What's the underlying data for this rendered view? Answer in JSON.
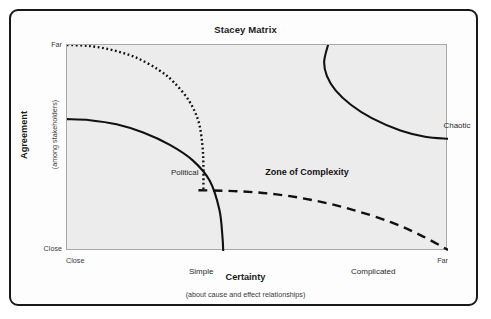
{
  "title": "Stacey Matrix",
  "axes": {
    "y": {
      "title": "Agreement",
      "subtitle": "(among stakeholders)",
      "tick_top": "Far",
      "tick_bottom": "Close"
    },
    "x": {
      "title": "Certainty",
      "subtitle": "(about cause and effect relationships)",
      "tick_left": "Close",
      "tick_right": "Far"
    }
  },
  "regions": [
    {
      "key": "political",
      "label": "Political",
      "style": "plain"
    },
    {
      "key": "zone",
      "label": "Zone of Complexity",
      "style": "bold"
    },
    {
      "key": "chaotic",
      "label": "Chaotic",
      "style": "plain"
    },
    {
      "key": "simple",
      "label": "Simple",
      "style": "plain"
    },
    {
      "key": "complicated",
      "label": "Complicated",
      "style": "plain"
    }
  ],
  "colors": {
    "frame_border": "#191919",
    "plot_fill": "#ececec",
    "plot_border": "#a8a8a8",
    "curve": "#111111",
    "page_background": "#ffffff",
    "text": "#2b2b2b"
  },
  "chart_data": {
    "type": "scatter",
    "title": "Stacey Matrix",
    "xlabel": "Certainty",
    "xlabel_sub": "(about cause and effect relationships)",
    "ylabel": "Agreement",
    "ylabel_sub": "(among stakeholders)",
    "xlim": [
      0,
      1
    ],
    "ylim": [
      0,
      1
    ],
    "xticks": [
      0,
      1
    ],
    "xticklabels": [
      "Close",
      "Far"
    ],
    "yticks": [
      0,
      1
    ],
    "yticklabels": [
      "Close",
      "Far"
    ],
    "grid": false,
    "legend": "none",
    "annotations": [
      {
        "text": "Political",
        "x": 0.12,
        "y": 0.62,
        "weight": "normal"
      },
      {
        "text": "Zone of Complexity",
        "x": 0.46,
        "y": 0.63,
        "weight": "bold"
      },
      {
        "text": "Chaotic",
        "x": 0.85,
        "y": 0.85,
        "weight": "normal"
      },
      {
        "text": "Simple",
        "x": 0.16,
        "y": 0.16,
        "weight": "normal"
      },
      {
        "text": "Complicated",
        "x": 0.6,
        "y": 0.16,
        "weight": "normal"
      }
    ],
    "series": [
      {
        "name": "Political boundary",
        "linestyle": "dotted",
        "points": [
          [
            0.0,
            1.0
          ],
          [
            0.06,
            0.995
          ],
          [
            0.12,
            0.975
          ],
          [
            0.18,
            0.94
          ],
          [
            0.24,
            0.88
          ],
          [
            0.28,
            0.82
          ],
          [
            0.32,
            0.73
          ],
          [
            0.345,
            0.63
          ],
          [
            0.355,
            0.52
          ],
          [
            0.358,
            0.42
          ],
          [
            0.358,
            0.3
          ]
        ]
      },
      {
        "name": "Simple boundary",
        "linestyle": "solid",
        "points": [
          [
            0.0,
            0.64
          ],
          [
            0.06,
            0.635
          ],
          [
            0.13,
            0.615
          ],
          [
            0.2,
            0.575
          ],
          [
            0.27,
            0.515
          ],
          [
            0.33,
            0.44
          ],
          [
            0.375,
            0.34
          ],
          [
            0.4,
            0.2
          ],
          [
            0.408,
            0.07
          ],
          [
            0.41,
            0.0
          ]
        ]
      },
      {
        "name": "Complicated boundary",
        "linestyle": "dashed",
        "points": [
          [
            0.345,
            0.295
          ],
          [
            0.45,
            0.29
          ],
          [
            0.55,
            0.275
          ],
          [
            0.65,
            0.245
          ],
          [
            0.75,
            0.2
          ],
          [
            0.85,
            0.14
          ],
          [
            0.93,
            0.075
          ],
          [
            1.0,
            0.005
          ]
        ]
      },
      {
        "name": "Chaotic boundary",
        "linestyle": "solid",
        "points": [
          [
            0.685,
            1.0
          ],
          [
            0.675,
            0.92
          ],
          [
            0.682,
            0.85
          ],
          [
            0.705,
            0.78
          ],
          [
            0.745,
            0.71
          ],
          [
            0.8,
            0.645
          ],
          [
            0.875,
            0.585
          ],
          [
            0.94,
            0.555
          ],
          [
            1.0,
            0.545
          ]
        ]
      }
    ]
  }
}
